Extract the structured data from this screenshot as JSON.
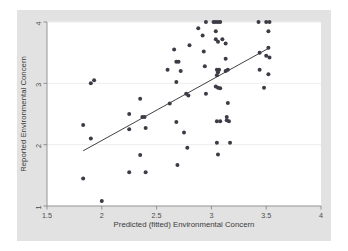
{
  "figure": {
    "background_color": "#e2e2e2",
    "plot_background_color": "#ffffff",
    "point_color": "#3c3c46",
    "line_color": "#2b2b33",
    "grid_color": "#ececec",
    "axis_color": "#8a8a8a"
  },
  "chart_data": {
    "type": "scatter",
    "title": "",
    "xlabel": "Predicted (fitted) Environmental Concern",
    "ylabel": "Reported Environmental Concern",
    "xlim": [
      1.5,
      4.0
    ],
    "ylim": [
      1.0,
      4.0
    ],
    "xticks": [
      1.5,
      2,
      2.5,
      3,
      3.5,
      4
    ],
    "xtick_labels": [
      "1.5",
      "2",
      "2.5",
      "3",
      "3.5",
      "4"
    ],
    "yticks": [
      1,
      2,
      3,
      4
    ],
    "ytick_labels": [
      "1",
      "2",
      "3",
      "4"
    ],
    "grid": true,
    "grid_axis": "y",
    "legend": null,
    "fit_line": {
      "label": "linear fit",
      "x": [
        1.83,
        3.53
      ],
      "y": [
        1.9,
        3.58
      ]
    },
    "points": [
      [
        1.83,
        2.32
      ],
      [
        1.83,
        1.45
      ],
      [
        1.9,
        3.0
      ],
      [
        1.9,
        2.1
      ],
      [
        1.93,
        3.05
      ],
      [
        2.0,
        1.08
      ],
      [
        2.25,
        2.5
      ],
      [
        2.25,
        2.25
      ],
      [
        2.25,
        1.55
      ],
      [
        2.35,
        2.75
      ],
      [
        2.35,
        1.83
      ],
      [
        2.37,
        2.45
      ],
      [
        2.39,
        2.45
      ],
      [
        2.4,
        2.27
      ],
      [
        2.4,
        1.55
      ],
      [
        2.6,
        3.22
      ],
      [
        2.62,
        2.67
      ],
      [
        2.66,
        3.55
      ],
      [
        2.68,
        3.35
      ],
      [
        2.7,
        3.35
      ],
      [
        2.68,
        3.02
      ],
      [
        2.68,
        2.37
      ],
      [
        2.69,
        1.67
      ],
      [
        2.72,
        3.2
      ],
      [
        2.75,
        2.2
      ],
      [
        2.77,
        2.83
      ],
      [
        2.79,
        2.8
      ],
      [
        2.78,
        1.95
      ],
      [
        2.8,
        3.62
      ],
      [
        2.88,
        3.9
      ],
      [
        2.92,
        3.78
      ],
      [
        2.93,
        3.52
      ],
      [
        2.94,
        3.28
      ],
      [
        2.95,
        2.83
      ],
      [
        3.02,
        4.0
      ],
      [
        3.04,
        4.0
      ],
      [
        3.06,
        4.0
      ],
      [
        3.08,
        4.0
      ],
      [
        3.04,
        3.85
      ],
      [
        3.04,
        3.72
      ],
      [
        3.06,
        3.68
      ],
      [
        3.05,
        3.22
      ],
      [
        3.07,
        3.22
      ],
      [
        3.06,
        3.18
      ],
      [
        3.05,
        3.13
      ],
      [
        3.04,
        2.95
      ],
      [
        3.06,
        2.93
      ],
      [
        3.08,
        2.92
      ],
      [
        3.05,
        2.38
      ],
      [
        3.08,
        2.38
      ],
      [
        3.05,
        2.03
      ],
      [
        3.06,
        1.84
      ],
      [
        3.1,
        3.72
      ],
      [
        3.13,
        3.65
      ],
      [
        3.13,
        3.4
      ],
      [
        3.13,
        3.2
      ],
      [
        3.15,
        3.22
      ],
      [
        3.15,
        2.68
      ],
      [
        3.14,
        2.45
      ],
      [
        3.14,
        2.4
      ],
      [
        3.16,
        2.38
      ],
      [
        3.17,
        2.03
      ],
      [
        2.95,
        4.0
      ],
      [
        3.43,
        4.0
      ],
      [
        3.5,
        4.0
      ],
      [
        3.53,
        4.0
      ],
      [
        3.52,
        3.85
      ],
      [
        3.44,
        3.5
      ],
      [
        3.5,
        3.45
      ],
      [
        3.52,
        3.58
      ],
      [
        3.53,
        3.42
      ],
      [
        3.44,
        3.22
      ],
      [
        3.52,
        3.15
      ],
      [
        3.48,
        2.93
      ]
    ]
  }
}
